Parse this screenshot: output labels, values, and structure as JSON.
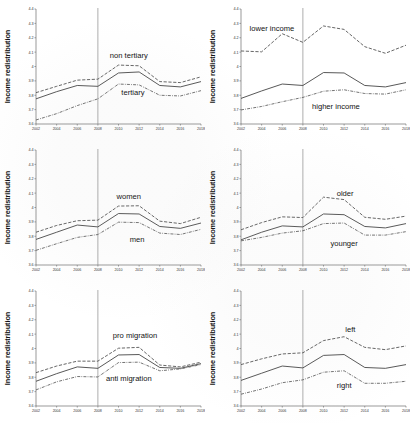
{
  "figure": {
    "ylabel": "Income redistribution",
    "xlabel": "",
    "ylim": [
      3.6,
      4.4
    ],
    "xlim": [
      2002,
      2018
    ],
    "yticks": [
      "3.6",
      "3.7",
      "3.8",
      "3.9",
      "4",
      "4.1",
      "4.2",
      "4.3",
      "4.4"
    ],
    "xticks": [
      "2002",
      "2004",
      "2006",
      "2008",
      "2010",
      "2012",
      "2014",
      "2016",
      "2018"
    ],
    "reference_line_year": "2008"
  },
  "chart_data": [
    {
      "type": "line",
      "panel": "education",
      "title": "",
      "xlabel": "",
      "ylabel": "Income redistribution",
      "x": [
        2002,
        2004,
        2006,
        2008,
        2010,
        2012,
        2014,
        2016,
        2018
      ],
      "xlim": [
        2002,
        2018
      ],
      "ylim": [
        3.6,
        4.4
      ],
      "grid": false,
      "legend": "inline-annotation",
      "annotations": [
        {
          "text": "non tertiary",
          "x": 2011.0,
          "y": 4.06
        },
        {
          "text": "tertiary",
          "x": 2011.4,
          "y": 3.8
        }
      ],
      "series": [
        {
          "name": "overall",
          "style": "solid",
          "values": [
            3.775,
            3.825,
            3.868,
            3.862,
            3.955,
            3.962,
            3.868,
            3.858,
            3.895
          ]
        },
        {
          "name": "non tertiary",
          "style": "dashed",
          "values": [
            3.818,
            3.862,
            3.905,
            3.912,
            4.01,
            4.005,
            3.895,
            3.888,
            3.928
          ]
        },
        {
          "name": "tertiary",
          "style": "dash-dot",
          "values": [
            3.628,
            3.672,
            3.728,
            3.775,
            3.878,
            3.872,
            3.8,
            3.795,
            3.832
          ]
        }
      ]
    },
    {
      "type": "line",
      "panel": "income",
      "title": "",
      "xlabel": "",
      "ylabel": "Income redistribution",
      "x": [
        2002,
        2004,
        2006,
        2008,
        2010,
        2012,
        2014,
        2016,
        2018
      ],
      "xlim": [
        2002,
        2018
      ],
      "ylim": [
        3.6,
        4.4
      ],
      "grid": false,
      "legend": "inline-annotation",
      "annotations": [
        {
          "text": "lower income",
          "x": 2005.0,
          "y": 4.245
        },
        {
          "text": "higher income",
          "x": 2011.2,
          "y": 3.705
        }
      ],
      "series": [
        {
          "name": "overall",
          "style": "solid",
          "values": [
            3.778,
            3.83,
            3.878,
            3.868,
            3.958,
            3.955,
            3.868,
            3.858,
            3.888
          ]
        },
        {
          "name": "lower income",
          "style": "dashed",
          "values": [
            4.108,
            4.102,
            4.228,
            4.168,
            4.282,
            4.258,
            4.138,
            4.092,
            4.148
          ]
        },
        {
          "name": "higher income",
          "style": "dash-dot",
          "values": [
            3.698,
            3.722,
            3.755,
            3.785,
            3.828,
            3.838,
            3.812,
            3.808,
            3.838
          ]
        }
      ]
    },
    {
      "type": "line",
      "panel": "gender",
      "title": "",
      "xlabel": "",
      "ylabel": "Income redistribution",
      "x": [
        2002,
        2004,
        2006,
        2008,
        2010,
        2012,
        2014,
        2016,
        2018
      ],
      "xlim": [
        2002,
        2018
      ],
      "ylim": [
        3.6,
        4.4
      ],
      "grid": false,
      "legend": "inline-annotation",
      "annotations": [
        {
          "text": "women",
          "x": 2011.0,
          "y": 4.062
        },
        {
          "text": "men",
          "x": 2011.8,
          "y": 3.762
        }
      ],
      "series": [
        {
          "name": "overall",
          "style": "solid",
          "values": [
            3.778,
            3.828,
            3.878,
            3.865,
            3.958,
            3.955,
            3.868,
            3.855,
            3.892
          ]
        },
        {
          "name": "women",
          "style": "dashed",
          "values": [
            3.828,
            3.875,
            3.908,
            3.912,
            4.01,
            4.012,
            3.905,
            3.888,
            3.932
          ]
        },
        {
          "name": "men",
          "style": "dash-dot",
          "values": [
            3.702,
            3.748,
            3.792,
            3.812,
            3.898,
            3.895,
            3.822,
            3.812,
            3.848
          ]
        }
      ]
    },
    {
      "type": "line",
      "panel": "age",
      "title": "",
      "xlabel": "",
      "ylabel": "Income redistribution",
      "x": [
        2002,
        2004,
        2006,
        2008,
        2010,
        2012,
        2014,
        2016,
        2018
      ],
      "xlim": [
        2002,
        2018
      ],
      "ylim": [
        3.6,
        4.4
      ],
      "grid": false,
      "legend": "inline-annotation",
      "annotations": [
        {
          "text": "older",
          "x": 2012.1,
          "y": 4.082
        },
        {
          "text": "younger",
          "x": 2012.0,
          "y": 3.735
        }
      ],
      "series": [
        {
          "name": "overall",
          "style": "solid",
          "values": [
            3.775,
            3.828,
            3.872,
            3.865,
            3.955,
            3.95,
            3.868,
            3.858,
            3.888
          ]
        },
        {
          "name": "older",
          "style": "dashed",
          "values": [
            3.845,
            3.895,
            3.935,
            3.93,
            4.072,
            4.055,
            3.932,
            3.918,
            3.94
          ]
        },
        {
          "name": "younger",
          "style": "dash-dot",
          "values": [
            3.768,
            3.792,
            3.822,
            3.838,
            3.888,
            3.892,
            3.808,
            3.808,
            3.832
          ]
        }
      ]
    },
    {
      "type": "line",
      "panel": "migration",
      "title": "",
      "xlabel": "",
      "ylabel": "Income redistribution",
      "x": [
        2002,
        2004,
        2006,
        2008,
        2010,
        2012,
        2014,
        2016,
        2018
      ],
      "xlim": [
        2002,
        2018
      ],
      "ylim": [
        3.6,
        4.4
      ],
      "grid": false,
      "legend": "inline-annotation",
      "annotations": [
        {
          "text": "pro migration",
          "x": 2011.6,
          "y": 4.072
        },
        {
          "text": "anti migration",
          "x": 2011.0,
          "y": 3.775
        }
      ],
      "series": [
        {
          "name": "overall",
          "style": "solid",
          "values": [
            3.772,
            3.825,
            3.872,
            3.862,
            3.955,
            3.958,
            3.868,
            3.862,
            3.895
          ]
        },
        {
          "name": "pro migration",
          "style": "dashed",
          "values": [
            3.832,
            3.878,
            3.912,
            3.912,
            4.002,
            4.008,
            3.885,
            3.872,
            3.905
          ]
        },
        {
          "name": "anti migration",
          "style": "dash-dot",
          "values": [
            3.712,
            3.768,
            3.805,
            3.802,
            3.902,
            3.905,
            3.845,
            3.858,
            3.888
          ]
        }
      ]
    },
    {
      "type": "line",
      "panel": "political-orientation",
      "title": "",
      "xlabel": "",
      "ylabel": "Income redistribution",
      "x": [
        2002,
        2004,
        2006,
        2008,
        2010,
        2012,
        2014,
        2016,
        2018
      ],
      "xlim": [
        2002,
        2018
      ],
      "ylim": [
        3.6,
        4.4
      ],
      "grid": false,
      "legend": "inline-annotation",
      "annotations": [
        {
          "text": "left",
          "x": 2012.6,
          "y": 4.118
        },
        {
          "text": "right",
          "x": 2012.0,
          "y": 3.722
        }
      ],
      "series": [
        {
          "name": "overall",
          "style": "solid",
          "values": [
            3.778,
            3.828,
            3.878,
            3.865,
            3.952,
            3.958,
            3.868,
            3.862,
            3.888
          ]
        },
        {
          "name": "left",
          "style": "dashed",
          "values": [
            3.888,
            3.928,
            3.962,
            3.97,
            4.055,
            4.082,
            4.008,
            3.992,
            4.018
          ]
        },
        {
          "name": "right",
          "style": "dash-dot",
          "values": [
            3.682,
            3.718,
            3.762,
            3.782,
            3.835,
            3.845,
            3.758,
            3.758,
            3.772
          ]
        }
      ]
    }
  ]
}
